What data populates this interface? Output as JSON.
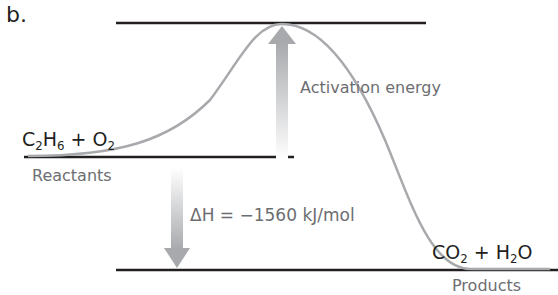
{
  "panel_label": "b.",
  "reactants": {
    "formula_parts": [
      "C",
      "2",
      "H",
      "6",
      " + O",
      "2"
    ],
    "label": "Reactants"
  },
  "products": {
    "formula_parts": [
      "CO",
      "2",
      " + H",
      "2",
      "O"
    ],
    "label": "Products"
  },
  "activation_energy_label": "Activation energy",
  "enthalpy_label": "ΔH = −1560 kJ/mol",
  "colors": {
    "lines": "#231f20",
    "curve": "#a7a9ac",
    "arrow": "#bcbec0",
    "text_gray": "#6d6e71"
  }
}
